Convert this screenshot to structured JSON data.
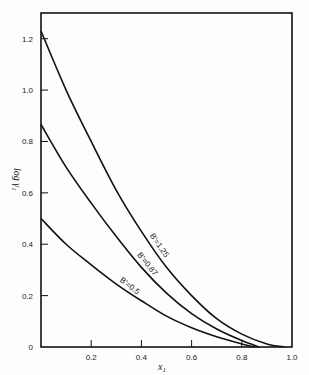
{
  "chart_data": {
    "type": "line",
    "title": "",
    "xlabel": "x",
    "xlabel_subscript": "1",
    "ylabel": "log γ",
    "ylabel_subscript": "1",
    "xlim": [
      0,
      1.0
    ],
    "ylim": [
      0,
      1.3
    ],
    "xticks": [
      0.2,
      0.4,
      0.6,
      0.8,
      1.0
    ],
    "xtick_labels": [
      "0.2",
      "0.4",
      "0.6",
      "0.8",
      "1.0"
    ],
    "yticks": [
      0,
      0.2,
      0.4,
      0.6,
      0.8,
      1.0,
      1.2
    ],
    "ytick_labels": [
      "0",
      "0.2",
      "0.4",
      "0.6",
      "0.8",
      "1.0",
      "1.2"
    ],
    "grid": false,
    "legend": "none",
    "series": [
      {
        "name": "B'=1.25",
        "label": "B'=1.25",
        "x": [
          0,
          0.1,
          0.2,
          0.3,
          0.4,
          0.5,
          0.6,
          0.7,
          0.8,
          0.9,
          0.97
        ],
        "y": [
          1.23,
          1.0,
          0.8,
          0.61,
          0.45,
          0.31,
          0.2,
          0.11,
          0.05,
          0.012,
          0.0
        ]
      },
      {
        "name": "B'=0.87",
        "label": "B'=0.87",
        "x": [
          0,
          0.1,
          0.2,
          0.3,
          0.4,
          0.5,
          0.6,
          0.7,
          0.8,
          0.87
        ],
        "y": [
          0.866,
          0.7,
          0.56,
          0.43,
          0.31,
          0.21,
          0.13,
          0.07,
          0.025,
          0.0
        ]
      },
      {
        "name": "B'=0.5",
        "label": "B'=0.5",
        "x": [
          0,
          0.1,
          0.2,
          0.3,
          0.4,
          0.5,
          0.6,
          0.7,
          0.8,
          0.85
        ],
        "y": [
          0.5,
          0.4,
          0.32,
          0.245,
          0.18,
          0.12,
          0.075,
          0.04,
          0.012,
          0.0
        ]
      }
    ],
    "annotations": [
      "B'=1.25",
      "B'=0.87",
      "B'=0.5"
    ]
  }
}
